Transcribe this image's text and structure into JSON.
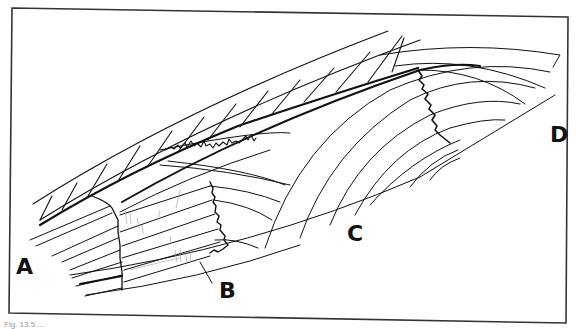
{
  "figure": {
    "caption": "Fig. 13.5 ...",
    "labels": {
      "a": "A",
      "b": "B",
      "c": "C",
      "d": "D"
    },
    "colors": {
      "ink": "#111111",
      "paper": "#ffffff",
      "sketch": "#9a9a9a"
    }
  }
}
